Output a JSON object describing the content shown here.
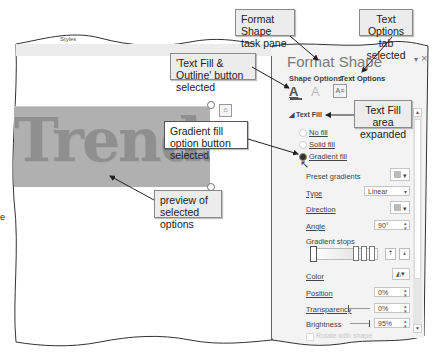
{
  "ribbon_fragment": {
    "label": "Styles"
  },
  "callouts": {
    "format_shape": "Format Shape task pane",
    "text_options": "Text Options tab selected",
    "text_fill_outline": "'Text Fill & Outline' button selected",
    "text_fill_area": "Text Fill area expanded",
    "gradient_fill_option": "Gradient fill option button selected",
    "preview": "preview of selected options"
  },
  "slide": {
    "wordart_text": "Trends in"
  },
  "pane": {
    "title": "Format Shape",
    "collapse_icon": "▾",
    "close_icon": "×",
    "tabs": [
      {
        "label": "Shape Options",
        "selected": false
      },
      {
        "label": "Text Options",
        "selected": true
      }
    ],
    "icon_buttons": [
      {
        "name": "text-fill-outline-icon",
        "glyph": "A",
        "selected": true
      },
      {
        "name": "text-effects-icon",
        "glyph": "A",
        "selected": false
      },
      {
        "name": "textbox-icon",
        "glyph": "A≡",
        "selected": false
      }
    ],
    "section": {
      "label": "Text Fill",
      "expanded": true
    },
    "fill_options": [
      {
        "label": "No fill",
        "selected": false
      },
      {
        "label": "Solid fill",
        "selected": false
      },
      {
        "label": "Gradient fill",
        "selected": true
      }
    ],
    "preset_gradients": {
      "label": "Preset gradients"
    },
    "type": {
      "label": "Type",
      "value": "Linear"
    },
    "direction": {
      "label": "Direction"
    },
    "angle": {
      "label": "Angle",
      "value": "90°"
    },
    "gradient_stops": {
      "label": "Gradient stops"
    },
    "color": {
      "label": "Color"
    },
    "position": {
      "label": "Position",
      "value": "0%"
    },
    "transparency": {
      "label": "Transparency",
      "value": "0%"
    },
    "brightness": {
      "label": "Brightness",
      "value": "95%"
    },
    "rotate": {
      "label": "Rotate with shape"
    }
  },
  "colors": {
    "pane_bg": "#f3f3f3",
    "selection_fill": "#b0b0b0",
    "wordart": "#8f8f8f"
  }
}
